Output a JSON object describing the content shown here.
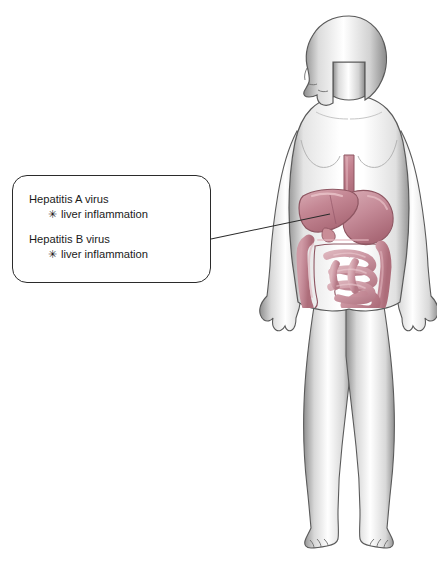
{
  "diagram": {
    "figure_name": "female-body-silhouette",
    "background_color": "#ffffff",
    "silhouette": {
      "outline_color": "#555555",
      "fill_color": "#ffffff",
      "shade_color": "#9a9a9a",
      "view": "anterior",
      "head_orientation": "profile-left"
    },
    "organs": {
      "accent_color": "#c2808e",
      "outline_color": "#8e5662",
      "highlight_color": "#e3b6bd",
      "parts": [
        "esophagus",
        "stomach",
        "liver",
        "gallbladder",
        "large-intestine",
        "small-intestine",
        "rectum"
      ]
    },
    "leader_line": {
      "color": "#2b2b2b",
      "from_label": "callout-box-right-edge",
      "to_label": "liver"
    }
  },
  "callout": {
    "border_color": "#2b2b2b",
    "background_color": "#ffffff",
    "bullet_glyph": "✳",
    "entries": [
      {
        "term": "Hepatitis A virus",
        "symptom": "liver inflammation"
      },
      {
        "term": "Hepatitis B virus",
        "symptom": "liver inflammation"
      }
    ]
  }
}
